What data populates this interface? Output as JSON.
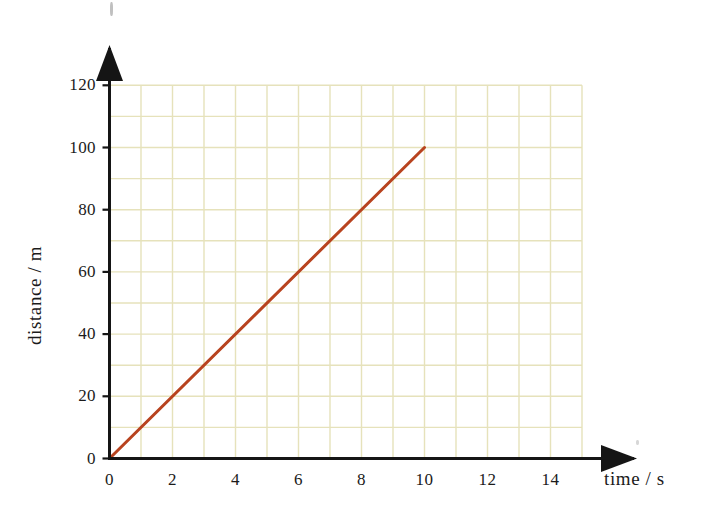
{
  "chart_data": {
    "type": "line",
    "title": "",
    "xlabel": "time / s",
    "ylabel": "distance / m",
    "xlim": [
      0,
      15
    ],
    "ylim": [
      0,
      120
    ],
    "xticks": [
      0,
      2,
      4,
      6,
      8,
      10,
      12,
      14
    ],
    "yticks": [
      0,
      20,
      40,
      60,
      80,
      100,
      120
    ],
    "xtick_labels": [
      "0",
      "2",
      "4",
      "6",
      "8",
      "10",
      "12",
      "14"
    ],
    "ytick_labels": [
      "0",
      "20",
      "40",
      "60",
      "80",
      "100",
      "120"
    ],
    "x_minor_step": 1,
    "y_minor_step": 10,
    "grid": true,
    "grid_color": "#e6e2bb",
    "legend": null,
    "series": [
      {
        "name": "distance",
        "color": "#b8431f",
        "line_width": 3,
        "x": [
          0,
          10
        ],
        "y": [
          0,
          100
        ],
        "slope": 10,
        "slope_units": "m/s",
        "points": [
          {
            "x": 0,
            "y": 0
          },
          {
            "x": 1,
            "y": 10
          },
          {
            "x": 2,
            "y": 20
          },
          {
            "x": 3,
            "y": 30
          },
          {
            "x": 4,
            "y": 40
          },
          {
            "x": 5,
            "y": 50
          },
          {
            "x": 6,
            "y": 60
          },
          {
            "x": 7,
            "y": 70
          },
          {
            "x": 8,
            "y": 80
          },
          {
            "x": 9,
            "y": 90
          },
          {
            "x": 10,
            "y": 100
          }
        ]
      }
    ]
  },
  "axes": {
    "x_title": "time / s",
    "y_title": "distance / m",
    "axis_color": "#151515",
    "arrow_heads": [
      "x-axis-arrow",
      "y-axis-arrow"
    ]
  },
  "icons": {
    "x_arrow": "arrow-right-icon",
    "y_arrow": "arrow-up-icon"
  }
}
